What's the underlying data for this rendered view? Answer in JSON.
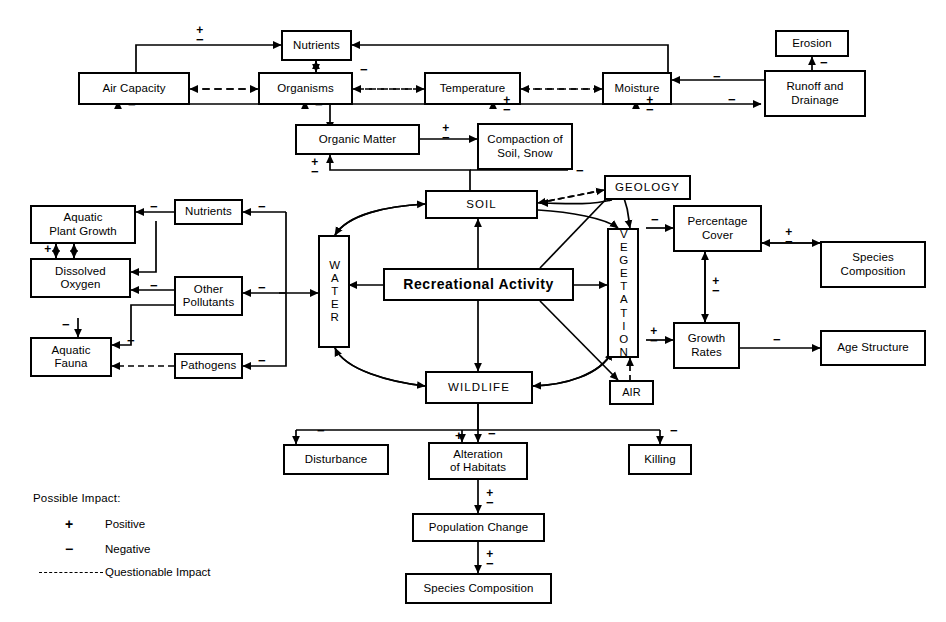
{
  "diagram": {
    "accent": "#000000",
    "background": "#ffffff"
  },
  "nodes": {
    "air_capacity": "Air Capacity",
    "nutrients_top": "Nutrients",
    "organisms": "Organisms",
    "temperature": "Temperature",
    "moisture": "Moisture",
    "erosion": "Erosion",
    "runoff_drainage": "Runoff and\nDrainage",
    "runoff_line1": "Runoff and",
    "runoff_line2": "Drainage",
    "organic_matter": "Organic Matter",
    "compaction_line1": "Compaction of",
    "compaction_line2": "Soil, Snow",
    "aquatic_plant_line1": "Aquatic",
    "aquatic_plant_line2": "Plant Growth",
    "dissolved_line1": "Dissolved",
    "dissolved_line2": "Oxygen",
    "aquatic_fauna_line1": "Aquatic",
    "aquatic_fauna_line2": "Fauna",
    "nutrients_water": "Nutrients",
    "other_pollutants_line1": "Other",
    "other_pollutants_line2": "Pollutants",
    "pathogens": "Pathogens",
    "water": "WATER",
    "soil": "SOIL",
    "geology": "GEOLOGY",
    "vegetation": "VEGETATION",
    "air": "AIR",
    "wildlife": "WILDLIFE",
    "recreational_activity": "Recreational  Activity",
    "percentage_cover_line1": "Percentage",
    "percentage_cover_line2": "Cover",
    "species_composition_line1": "Species",
    "species_composition_line2": "Composition",
    "growth_rates_line1": "Growth",
    "growth_rates_line2": "Rates",
    "age_structure": "Age Structure",
    "disturbance": "Disturbance",
    "alteration_line1": "Alteration",
    "alteration_line2": "of Habitats",
    "killing": "Killing",
    "population_change": "Population Change",
    "species_composition_bottom": "Species Composition"
  },
  "signs": {
    "plus": "+",
    "minus": "−",
    "plusminus_plus": "+",
    "plusminus_minus": "−"
  },
  "legend": {
    "title": "Possible Impact:",
    "items": [
      {
        "symbol": "+",
        "label": "Positive",
        "type": "glyph"
      },
      {
        "symbol": "−",
        "label": "Negative",
        "type": "glyph"
      },
      {
        "symbol": "",
        "label": "Questionable Impact",
        "type": "dashed-line"
      }
    ]
  },
  "edge_signs": [
    {
      "id": "s-aircap-nutrients",
      "value": "±"
    },
    {
      "id": "s-nutrients-organisms-minus",
      "value": "−"
    },
    {
      "id": "s-aircap-below",
      "value": "−"
    },
    {
      "id": "s-organisms-below",
      "value": "−"
    },
    {
      "id": "s-temperature-below",
      "value": "±"
    },
    {
      "id": "s-moisture-below",
      "value": "±"
    },
    {
      "id": "s-runoff-moisture",
      "value": "−"
    },
    {
      "id": "s-runoff-lower",
      "value": "−"
    },
    {
      "id": "s-runoff-erosion",
      "value": "−"
    },
    {
      "id": "s-organic-compaction",
      "value": "±"
    },
    {
      "id": "s-soil-organic",
      "value": "±"
    },
    {
      "id": "s-compaction-soil",
      "value": "−"
    },
    {
      "id": "s-nutrients-aquatic",
      "value": "−"
    },
    {
      "id": "s-water-nutrients",
      "value": "−"
    },
    {
      "id": "s-plant-do",
      "value": "±"
    },
    {
      "id": "s-pollut-do",
      "value": "−"
    },
    {
      "id": "s-water-pollut",
      "value": "−"
    },
    {
      "id": "s-do-fauna",
      "value": "−"
    },
    {
      "id": "s-pollut-fauna",
      "value": "−"
    },
    {
      "id": "s-water-pathogens",
      "value": "−"
    },
    {
      "id": "s-veg-cover",
      "value": "−"
    },
    {
      "id": "s-cover-species",
      "value": "±"
    },
    {
      "id": "s-cover-growth",
      "value": "±"
    },
    {
      "id": "s-veg-growth",
      "value": "±"
    },
    {
      "id": "s-growth-age",
      "value": "−"
    },
    {
      "id": "s-wild-disturb",
      "value": "−"
    },
    {
      "id": "s-wild-alter-plus",
      "value": "+"
    },
    {
      "id": "s-wild-alter-minus",
      "value": "−"
    },
    {
      "id": "s-wild-killing",
      "value": "−"
    },
    {
      "id": "s-alter-pop",
      "value": "±"
    },
    {
      "id": "s-pop-species",
      "value": "±"
    }
  ]
}
